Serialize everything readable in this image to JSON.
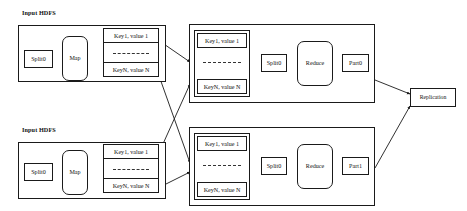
{
  "diagram": {
    "type": "dataflow-diagram",
    "canvas": {
      "width": 467,
      "height": 211
    },
    "colors": {
      "background": "#ffffff",
      "stroke": "#1a1a1a",
      "text": "#111111",
      "dashed_separator": "#333333"
    }
  },
  "map_stages": [
    {
      "id": "map-stage-top",
      "group_label": "Input HDFS",
      "split_label": "Split0",
      "map_label": "Map",
      "kv_first": "Key1, value 1",
      "kv_last": "KeyN, value N",
      "kv_separator": "............."
    },
    {
      "id": "map-stage-bottom",
      "group_label": "Input HDFS",
      "split_label": "Split0",
      "map_label": "Map",
      "kv_first": "Key1, value 1",
      "kv_last": "KeyN, value N",
      "kv_separator": "............."
    }
  ],
  "reduce_stages": [
    {
      "id": "reduce-stage-top",
      "kv_first": "Key1, value 1",
      "kv_last": "KeyN, value N",
      "kv_separator": "..............",
      "split_label": "Split0",
      "reduce_label": "Reduce",
      "part_label": "Part0"
    },
    {
      "id": "reduce-stage-bottom",
      "kv_first": "Key1, value 1",
      "kv_last": "KeyN, value N",
      "kv_separator": "..............",
      "split_label": "Split0",
      "reduce_label": "Reduce",
      "part_label": "Part1"
    }
  ],
  "output": {
    "replication_label": "Replication"
  }
}
